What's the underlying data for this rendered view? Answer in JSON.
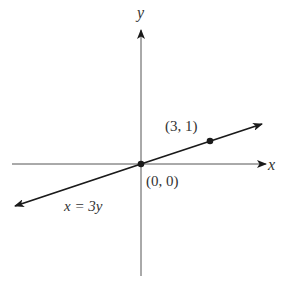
{
  "diagram": {
    "type": "coordinate-plane",
    "axes": {
      "x_label": "x",
      "y_label": "y"
    },
    "line": {
      "equation_label": "x = 3y",
      "slope": 0.3333
    },
    "points": [
      {
        "label": "(0, 0)",
        "x": 0,
        "y": 0
      },
      {
        "label": "(3, 1)",
        "x": 3,
        "y": 1
      }
    ],
    "colors": {
      "stroke": "#1a1a1a",
      "axis": "#555555",
      "text": "#333333"
    }
  }
}
